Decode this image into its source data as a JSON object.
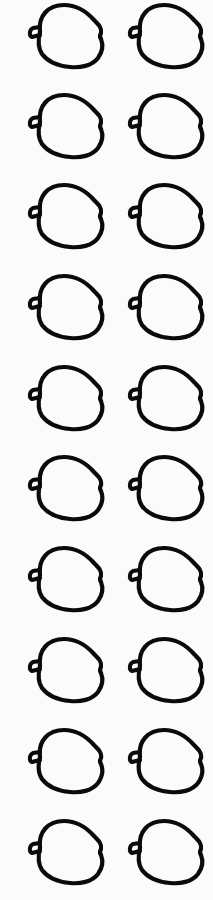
{
  "sheet": {
    "background": "#fbfbfb",
    "stroke_color": "#0a0a0a",
    "icon": "apple-outline-icon",
    "rows": 10,
    "columns": 2,
    "column_x": [
      26,
      126
    ],
    "row_y": [
      2,
      92,
      182,
      273,
      364,
      454,
      545,
      636,
      727,
      818
    ]
  }
}
